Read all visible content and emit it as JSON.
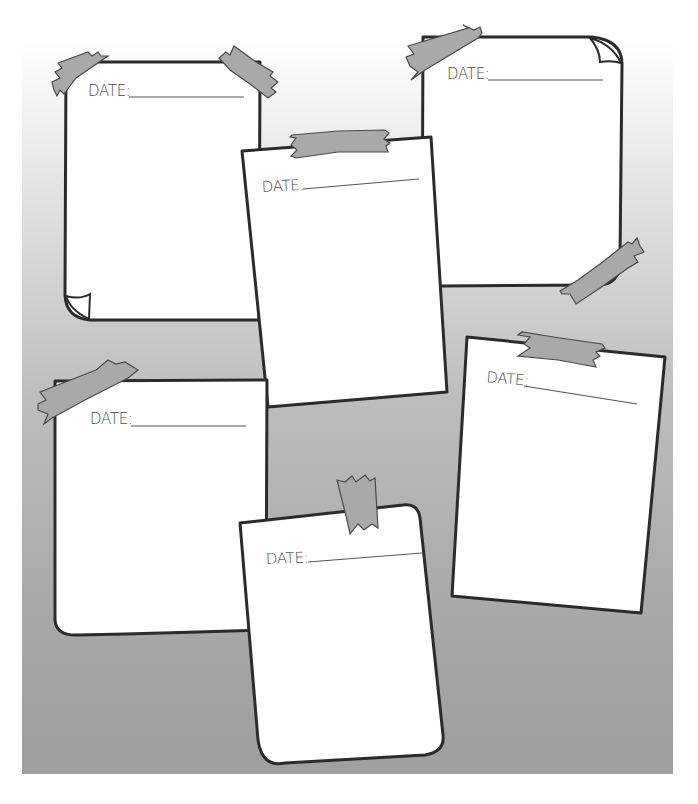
{
  "colors": {
    "outline": "#2b2b2b",
    "paper": "#ffffff",
    "tape": "#a9a9a9",
    "tape_outline": "#4a4a4a",
    "text": "#4a4a4a",
    "board_top": "#ffffff",
    "board_bottom": "#9f9f9f"
  },
  "notes": [
    {
      "id": "note-top-left",
      "label": "DATE:"
    },
    {
      "id": "note-top-center",
      "label": "DATE:"
    },
    {
      "id": "note-top-right",
      "label": "DATE:"
    },
    {
      "id": "note-middle-right",
      "label": "DATE:"
    },
    {
      "id": "note-bottom-left",
      "label": "DATE:"
    },
    {
      "id": "note-bottom-center",
      "label": "DATE:"
    }
  ],
  "icons": {
    "tape": "masking-tape-icon",
    "curl": "page-curl-icon"
  }
}
